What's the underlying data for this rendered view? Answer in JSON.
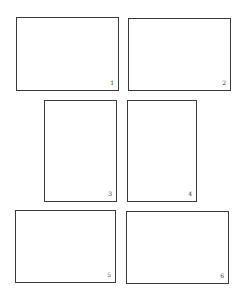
{
  "figure": {
    "line_color": "#3a3a3a",
    "background": "#ffffff",
    "frames": [
      {
        "label": "1",
        "orientation": "landscape",
        "x": 16,
        "y": 17,
        "w": 103,
        "h": 74
      },
      {
        "label": "2",
        "orientation": "landscape",
        "x": 128,
        "y": 18,
        "w": 103,
        "h": 73
      },
      {
        "label": "3",
        "orientation": "portrait",
        "x": 44,
        "y": 100,
        "w": 73,
        "h": 102
      },
      {
        "label": "4",
        "orientation": "portrait",
        "x": 127,
        "y": 100,
        "w": 70,
        "h": 102
      },
      {
        "label": "5",
        "orientation": "landscape",
        "x": 15,
        "y": 210,
        "w": 101,
        "h": 73
      },
      {
        "label": "6",
        "orientation": "landscape",
        "x": 126,
        "y": 211,
        "w": 103,
        "h": 73
      }
    ]
  }
}
